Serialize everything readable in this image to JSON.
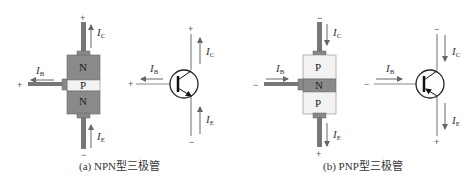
{
  "figure": {
    "npn": {
      "caption": "(a) NPN型三极管",
      "layers": [
        "N",
        "P",
        "N"
      ],
      "labels": {
        "ic": "I",
        "ic_sub": "C",
        "ib": "I",
        "ib_sub": "B",
        "ie": "I",
        "ie_sub": "E"
      },
      "signs": {
        "collector": "+",
        "base": "+",
        "emitter": "−"
      },
      "symbol_signs": {
        "collector": "+",
        "base": "+",
        "emitter": "−"
      },
      "colors": {
        "n_region": "#8a8a8a",
        "p_region": "#f2f2f2",
        "lead": "#777777"
      }
    },
    "pnp": {
      "caption": "(b) PNP型三极管",
      "layers": [
        "P",
        "N",
        "P"
      ],
      "labels": {
        "ic": "I",
        "ic_sub": "C",
        "ib": "I",
        "ib_sub": "B",
        "ie": "I",
        "ie_sub": "E"
      },
      "signs": {
        "collector": "−",
        "base": "−",
        "emitter": "+"
      },
      "symbol_signs": {
        "collector": "−",
        "base": "−",
        "emitter": "+"
      },
      "colors": {
        "n_region": "#8a8a8a",
        "p_region": "#f2f2f2",
        "lead": "#777777"
      }
    }
  }
}
